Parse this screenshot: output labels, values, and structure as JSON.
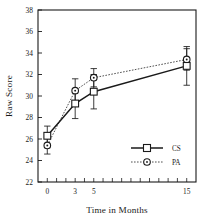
{
  "chart_data": {
    "type": "line",
    "title": "",
    "xlabel": "Time in Months",
    "ylabel": "Raw Score",
    "x": [
      0,
      3,
      5,
      15
    ],
    "xlim": [
      -1,
      16
    ],
    "ylim": [
      22,
      38
    ],
    "xticklabels": [
      "0",
      "3",
      "5",
      "15"
    ],
    "yticklabels": [
      "22",
      "24",
      "26",
      "28",
      "30",
      "32",
      "34",
      "36",
      "38"
    ],
    "yticks": [
      22,
      24,
      26,
      28,
      30,
      32,
      34,
      36,
      38
    ],
    "grid": false,
    "legend_position": "lower-right",
    "error_bars": "standard-error",
    "frame": "box",
    "series": [
      {
        "name": "CS",
        "label": "CS",
        "marker": "open-square",
        "linestyle": "solid",
        "color": "#1a1a1a",
        "values": [
          26.3,
          29.3,
          30.4,
          32.8
        ],
        "errors": [
          0.9,
          1.4,
          1.6,
          1.8
        ]
      },
      {
        "name": "PA",
        "label": "PA",
        "marker": "open-circle",
        "linestyle": "dotted",
        "color": "#3d3d3d",
        "values": [
          25.4,
          30.5,
          31.7,
          33.4
        ],
        "errors": [
          0.8,
          1.1,
          0.85,
          1.0
        ]
      }
    ]
  },
  "legend": {
    "entries": [
      {
        "label": "CS"
      },
      {
        "label": "PA"
      }
    ]
  },
  "axes": {
    "x_title": "Time in Months",
    "y_title": "Raw Score"
  }
}
